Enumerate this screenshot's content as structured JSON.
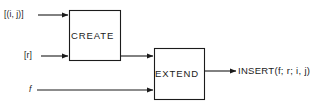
{
  "figure": {
    "type": "block-flow-diagram",
    "background_color": "#ffffff",
    "stroke_color": "#1b1b1b",
    "text_color": "#1b1b1b"
  },
  "blocks": [
    {
      "id": "create",
      "label": "CREATE"
    },
    {
      "id": "extend",
      "label": "EXTEND"
    }
  ],
  "inputs": [
    {
      "id": "ij",
      "label": "[(i, j)]",
      "target": "CREATE"
    },
    {
      "id": "r",
      "label": "[r]",
      "target": "CREATE"
    },
    {
      "id": "f",
      "label": "f",
      "target": "EXTEND"
    }
  ],
  "connections": [
    {
      "id": "create-to-extend",
      "from": "CREATE",
      "to": "EXTEND"
    }
  ],
  "outputs": [
    {
      "id": "insert",
      "label": "INSERT(f; r; i, j)",
      "from": "EXTEND"
    }
  ]
}
